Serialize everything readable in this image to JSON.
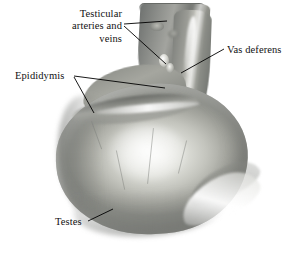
{
  "figure": {
    "type": "anatomical-photograph",
    "background_color": "#ffffff",
    "label_color": "#111111",
    "leader_color": "#000000"
  },
  "labels": [
    {
      "id": "testicular-arteries-and-veins",
      "text": "Testicular\narteries and\nveins",
      "align": "right",
      "x": 44,
      "y": 8
    },
    {
      "id": "vas-deferens",
      "text": "Vas deferens",
      "align": "left",
      "x": 227,
      "y": 44
    },
    {
      "id": "epididymis",
      "text": "Epididymis",
      "align": "left",
      "x": 15,
      "y": 70
    },
    {
      "id": "testes",
      "text": "Testes",
      "align": "left",
      "x": 55,
      "y": 216
    }
  ],
  "leader_lines": [
    {
      "id": "leader-arteries-upper",
      "x1": 124,
      "y1": 24,
      "x2": 167,
      "y2": 21
    },
    {
      "id": "leader-arteries-lower",
      "x1": 124,
      "y1": 26,
      "x2": 166,
      "y2": 64
    },
    {
      "id": "leader-epididymis-upper",
      "x1": 74,
      "y1": 76,
      "x2": 165,
      "y2": 88
    },
    {
      "id": "leader-epididymis-lower",
      "x1": 74,
      "y1": 77,
      "x2": 94,
      "y2": 113
    },
    {
      "id": "leader-vas-deferens",
      "x1": 224,
      "y1": 49,
      "x2": 181,
      "y2": 73
    },
    {
      "id": "leader-testes",
      "x1": 88,
      "y1": 221,
      "x2": 113,
      "y2": 209
    }
  ],
  "specimen_regions": [
    {
      "id": "spermatic-cord",
      "label": "spermatic cord"
    },
    {
      "id": "vas-deferens-bundle",
      "label": "vas deferens"
    },
    {
      "id": "testicular-vessels",
      "label": "testicular arteries and veins"
    },
    {
      "id": "epididymis-head",
      "label": "epididymis head"
    },
    {
      "id": "epididymis-body",
      "label": "epididymis body"
    },
    {
      "id": "epididymis-tail",
      "label": "epididymis tail"
    },
    {
      "id": "testis-body",
      "label": "testis"
    }
  ]
}
